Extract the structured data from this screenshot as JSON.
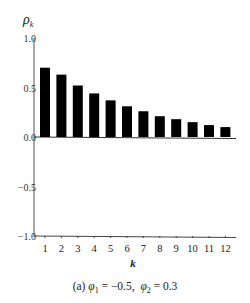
{
  "chart_data": {
    "type": "bar",
    "title": "",
    "ylabel": "ρ_k",
    "xlabel": "k",
    "categories": [
      "1",
      "2",
      "3",
      "4",
      "5",
      "6",
      "7",
      "8",
      "9",
      "10",
      "11",
      "12"
    ],
    "values": [
      0.7,
      0.63,
      0.52,
      0.44,
      0.37,
      0.31,
      0.26,
      0.21,
      0.18,
      0.15,
      0.12,
      0.1
    ],
    "ylim": [
      -1.0,
      1.0
    ],
    "yticks": [
      "1.0",
      "0.5",
      "0.0",
      "−0.5",
      "−1.0"
    ],
    "ytick_values": [
      1.0,
      0.5,
      0.0,
      -0.5,
      -1.0
    ],
    "grid": false,
    "legend": null,
    "bar_color": "#000000",
    "caption": "(a) φ1 = −0.5, φ2 = 0.3"
  },
  "caption": {
    "prefix": "(a) ",
    "phi1_symbol": "φ",
    "phi1_sub": "1",
    "phi1_value": " = −0.5,  ",
    "phi2_symbol": "φ",
    "phi2_sub": "2",
    "phi2_value": " = 0.3"
  }
}
